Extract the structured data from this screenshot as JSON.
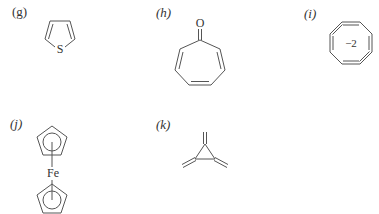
{
  "figure": {
    "structures": [
      {
        "id": "g",
        "label": "(g)",
        "name": "thiophene",
        "atoms": [
          "S"
        ]
      },
      {
        "id": "h",
        "label": "(h)",
        "name": "tropone",
        "atoms": [
          "O"
        ]
      },
      {
        "id": "i",
        "label": "(i)",
        "name": "cyclooctatetraene dianion",
        "charge": "−2"
      },
      {
        "id": "j",
        "label": "(j)",
        "name": "ferrocene",
        "atoms": [
          "Fe"
        ]
      },
      {
        "id": "k",
        "label": "(k)",
        "name": "trimethylenecyclopropane"
      }
    ]
  }
}
